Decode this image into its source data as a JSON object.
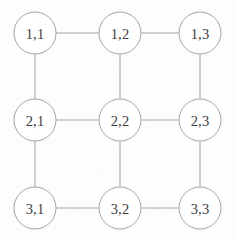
{
  "diagram": {
    "type": "undirected-grid-graph",
    "rows": 3,
    "columns": 3,
    "canvas": {
      "width": 236,
      "height": 240
    },
    "style": {
      "background_color": "#fdfdfc",
      "node_fill_color": "#ffffff",
      "node_stroke_color": "#9a9a9a",
      "edge_color": "#9a9a9a",
      "label_color": "#3d3d3d",
      "node_radius": 21,
      "stroke_width": 0.9
    },
    "nodes": [
      {
        "id": "n11",
        "label": "1,1",
        "row": 1,
        "col": 1,
        "cx": 35,
        "cy": 33,
        "r": 21
      },
      {
        "id": "n12",
        "label": "1,2",
        "row": 1,
        "col": 2,
        "cx": 120,
        "cy": 33,
        "r": 21
      },
      {
        "id": "n13",
        "label": "1,3",
        "row": 1,
        "col": 3,
        "cx": 200,
        "cy": 33,
        "r": 21
      },
      {
        "id": "n21",
        "label": "2,1",
        "row": 2,
        "col": 1,
        "cx": 35,
        "cy": 120,
        "r": 21
      },
      {
        "id": "n22",
        "label": "2,2",
        "row": 2,
        "col": 2,
        "cx": 120,
        "cy": 120,
        "r": 21
      },
      {
        "id": "n23",
        "label": "2,3",
        "row": 2,
        "col": 3,
        "cx": 200,
        "cy": 120,
        "r": 21
      },
      {
        "id": "n31",
        "label": "3,1",
        "row": 3,
        "col": 1,
        "cx": 35,
        "cy": 208,
        "r": 21
      },
      {
        "id": "n32",
        "label": "3,2",
        "row": 3,
        "col": 2,
        "cx": 120,
        "cy": 208,
        "r": 21
      },
      {
        "id": "n33",
        "label": "3,3",
        "row": 3,
        "col": 3,
        "cx": 200,
        "cy": 208,
        "r": 21
      }
    ],
    "edges": [
      {
        "id": "e-1-1_1-2",
        "from": "n11",
        "to": "n12",
        "orientation": "horizontal"
      },
      {
        "id": "e-1-2_1-3",
        "from": "n12",
        "to": "n13",
        "orientation": "horizontal"
      },
      {
        "id": "e-2-1_2-2",
        "from": "n21",
        "to": "n22",
        "orientation": "horizontal"
      },
      {
        "id": "e-2-2_2-3",
        "from": "n22",
        "to": "n23",
        "orientation": "horizontal"
      },
      {
        "id": "e-3-1_3-2",
        "from": "n31",
        "to": "n32",
        "orientation": "horizontal"
      },
      {
        "id": "e-3-2_3-3",
        "from": "n32",
        "to": "n33",
        "orientation": "horizontal"
      },
      {
        "id": "e-1-1_2-1",
        "from": "n11",
        "to": "n21",
        "orientation": "vertical"
      },
      {
        "id": "e-2-1_3-1",
        "from": "n21",
        "to": "n31",
        "orientation": "vertical"
      },
      {
        "id": "e-1-2_2-2",
        "from": "n12",
        "to": "n22",
        "orientation": "vertical"
      },
      {
        "id": "e-2-2_3-2",
        "from": "n22",
        "to": "n32",
        "orientation": "vertical"
      },
      {
        "id": "e-1-3_2-3",
        "from": "n13",
        "to": "n23",
        "orientation": "vertical"
      },
      {
        "id": "e-2-3_3-3",
        "from": "n23",
        "to": "n33",
        "orientation": "vertical"
      }
    ]
  }
}
